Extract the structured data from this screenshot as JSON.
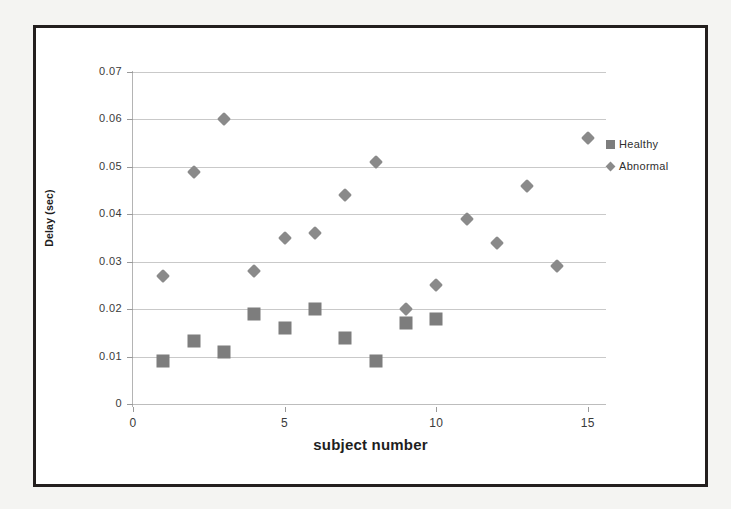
{
  "chart_data": {
    "type": "scatter",
    "title": "",
    "xlabel": "subject number",
    "ylabel": "Delay (sec)",
    "xlim": [
      0,
      15.6
    ],
    "ylim": [
      0,
      0.07
    ],
    "xticks": [
      0,
      5,
      10,
      15
    ],
    "xtick_labels": [
      "0",
      "5",
      "10",
      "15"
    ],
    "yticks": [
      0,
      0.01,
      0.02,
      0.03,
      0.04,
      0.05,
      0.06,
      0.07
    ],
    "ytick_labels": [
      "0",
      "0.01",
      "0.02",
      "0.03",
      "0.04",
      "0.05",
      "0.06",
      "0.07"
    ],
    "grid": "horizontal",
    "legend_position": "right",
    "x": [
      1,
      2,
      3,
      4,
      5,
      6,
      7,
      8,
      9,
      10,
      11,
      12,
      13,
      14,
      15
    ],
    "series": [
      {
        "name": "Healthy",
        "marker": "square",
        "color": "#7d7d7d",
        "x": [
          1,
          2,
          3,
          4,
          5,
          6,
          7,
          8,
          9,
          10
        ],
        "values": [
          0.009,
          0.0133,
          0.011,
          0.019,
          0.016,
          0.02,
          0.014,
          0.009,
          0.017,
          0.018
        ]
      },
      {
        "name": "Abnormal",
        "marker": "diamond",
        "color": "#8a8a8a",
        "x": [
          1,
          2,
          3,
          4,
          5,
          6,
          7,
          8,
          9,
          10,
          11,
          12,
          13,
          14,
          15
        ],
        "values": [
          0.027,
          0.049,
          0.06,
          0.028,
          0.035,
          0.036,
          0.044,
          0.051,
          0.02,
          0.025,
          0.039,
          0.034,
          0.046,
          0.029,
          0.056
        ]
      }
    ]
  },
  "legend": {
    "entries": [
      {
        "label": "Healthy",
        "marker": "square"
      },
      {
        "label": "Abnormal",
        "marker": "diamond"
      }
    ]
  },
  "colors": {
    "healthy": "#7d7d7d",
    "abnormal": "#8a8a8a",
    "frame": "#231f1e",
    "gridline": "#c9c9c9",
    "page_background": "#f4f4f2",
    "plot_background": "#ffffff"
  }
}
